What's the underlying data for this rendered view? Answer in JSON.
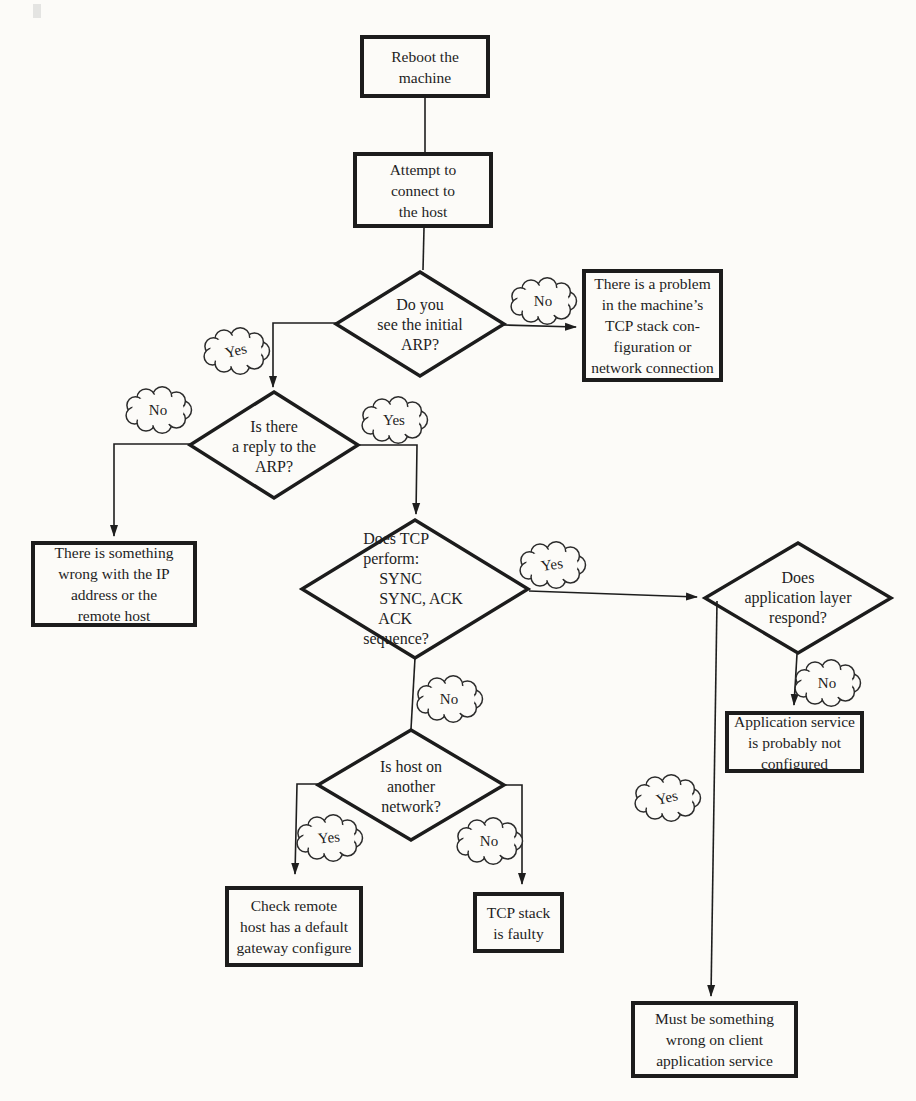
{
  "figure": {
    "colors": {
      "ink": "#1e1e1e",
      "paper": "#fcfbf8"
    }
  },
  "nodes": {
    "reboot": {
      "text": "Reboot the\nmachine"
    },
    "attempt": {
      "text": "Attempt to\nconnect to\nthe host"
    },
    "tcp_problem": {
      "text": "There is a problem\nin the machine’s\nTCP stack con-\nfiguration or\nnetwork connection"
    },
    "ip_wrong": {
      "text": "There is something\nwrong with the IP\naddress or the\nremote host"
    },
    "app_service": {
      "text": "Application service\nis probably not\nconfigured"
    },
    "gateway": {
      "text": "Check remote\nhost has a default\ngateway configure"
    },
    "tcp_faulty": {
      "text": "TCP stack\nis faulty"
    },
    "client_app": {
      "text": "Must be something\nwrong on client\napplication service"
    }
  },
  "decisions": {
    "see_arp": {
      "text": "Do you\nsee the initial\nARP?"
    },
    "arp_reply": {
      "text": "Is there\na reply to the\nARP?"
    },
    "tcp_sequence": {
      "text": "Does TCP\nperform:\n    SYNC\n    SYNC, ACK\n    ACK\nsequence?"
    },
    "app_layer": {
      "text": "Does\napplication layer\nrespond?"
    },
    "another_network": {
      "text": "Is host on\nanother\nnetwork?"
    }
  },
  "labels": {
    "yes": "Yes",
    "no": "No"
  }
}
